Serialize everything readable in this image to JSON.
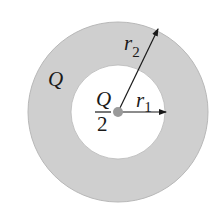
{
  "diagram": {
    "title": "",
    "shell": {
      "charge_label": "Q",
      "outer_radius_label": "r",
      "outer_radius_subscript": "2",
      "fill_color": "#cfcfcf",
      "edge_color": "#b8b8b8"
    },
    "inner_region": {
      "fill_color": "#ffffff"
    },
    "center_charge": {
      "numerator": "Q",
      "denominator": "2",
      "dot_color": "#9a9a9a"
    },
    "inner_radius": {
      "label": "r",
      "subscript": "1"
    }
  }
}
